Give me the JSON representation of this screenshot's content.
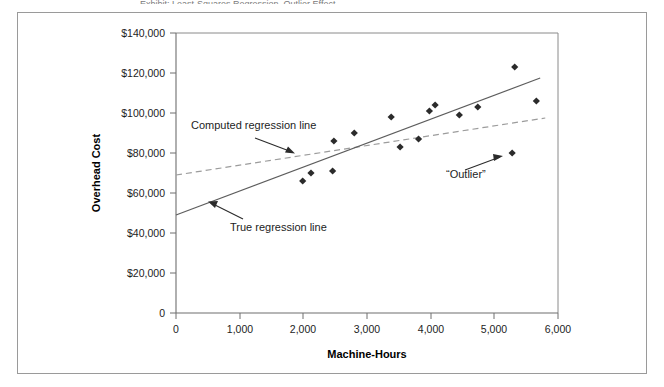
{
  "figure": {
    "caption_sliver": "Exhibit: Least-Squares Regression, Outlier Effect",
    "border_color": "#9a9a9a",
    "background": "#ffffff"
  },
  "chart_data": {
    "type": "scatter",
    "title": "",
    "xlabel": "Machine-Hours",
    "ylabel": "Overhead Cost",
    "xlim": [
      0,
      6000
    ],
    "ylim": [
      0,
      140000
    ],
    "grid": false,
    "legend": "none",
    "x_ticks": [
      0,
      1000,
      2000,
      3000,
      4000,
      5000,
      6000
    ],
    "x_tick_labels": [
      "0",
      "1,000",
      "2,000",
      "3,000",
      "4,000",
      "5,000",
      "6,000"
    ],
    "y_ticks": [
      0,
      20000,
      40000,
      60000,
      80000,
      100000,
      120000,
      140000
    ],
    "y_tick_labels": [
      "0",
      "$20,000",
      "$40,000",
      "$60,000",
      "$80,000",
      "$100,000",
      "$120,000",
      "$140,000"
    ],
    "points": [
      {
        "x": 1990,
        "y": 66000
      },
      {
        "x": 2120,
        "y": 70000
      },
      {
        "x": 2460,
        "y": 71000
      },
      {
        "x": 2480,
        "y": 86000
      },
      {
        "x": 2800,
        "y": 90000
      },
      {
        "x": 3380,
        "y": 98000
      },
      {
        "x": 3520,
        "y": 83000
      },
      {
        "x": 3810,
        "y": 87000
      },
      {
        "x": 3980,
        "y": 101000
      },
      {
        "x": 4070,
        "y": 104000
      },
      {
        "x": 4450,
        "y": 99000
      },
      {
        "x": 4740,
        "y": 103000
      },
      {
        "x": 5320,
        "y": 123000
      },
      {
        "x": 5660,
        "y": 106000
      },
      {
        "x": 5280,
        "y": 80000
      }
    ],
    "series": [
      {
        "name": "True regression line",
        "style": "solid",
        "color": "#5d5d5d",
        "x": [
          0,
          5720
        ],
        "y": [
          49000,
          117500
        ]
      },
      {
        "name": "Computed regression line",
        "style": "dashed",
        "color": "#9c9c9c",
        "x": [
          0,
          5800
        ],
        "y": [
          69000,
          97500
        ]
      }
    ],
    "annotations": [
      {
        "label": "Computed regression line",
        "target": "computed-regression-line"
      },
      {
        "label": "True regression line",
        "target": "true-regression-line"
      },
      {
        "label": "“Outlier”",
        "target": "outlier-point"
      }
    ]
  }
}
